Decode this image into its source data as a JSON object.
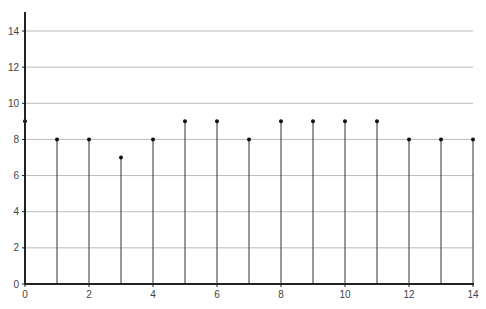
{
  "chart_data": {
    "type": "stem",
    "title": "",
    "xlabel": "",
    "ylabel": "",
    "x": [
      0,
      1,
      2,
      3,
      4,
      5,
      6,
      7,
      8,
      9,
      10,
      11,
      12,
      13,
      14
    ],
    "values": [
      9,
      8,
      8,
      7,
      8,
      9,
      9,
      8,
      9,
      9,
      9,
      9,
      8,
      8,
      8
    ],
    "xlim": [
      0,
      14
    ],
    "ylim": [
      0,
      15
    ],
    "x_ticks": [
      0,
      2,
      4,
      6,
      8,
      10,
      12,
      14
    ],
    "y_ticks": [
      0,
      2,
      4,
      6,
      8,
      10,
      12,
      14
    ],
    "grid": {
      "horizontal": true,
      "vertical": false
    },
    "legend": null
  },
  "colors": {
    "axis": "#222222",
    "grid": "#bbbbbb",
    "stem": "#333333",
    "marker": "#111111"
  }
}
